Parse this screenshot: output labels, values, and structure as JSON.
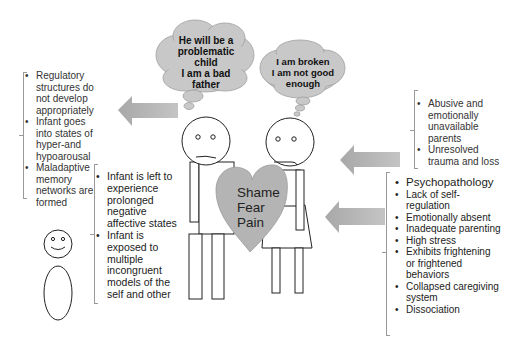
{
  "thought_bubbles": {
    "father": {
      "lines": [
        "He will be a",
        "problematic",
        "child",
        "I am a bad",
        "father"
      ]
    },
    "mother": {
      "lines": [
        "I am broken",
        "I am not good",
        "enough"
      ]
    }
  },
  "heart": {
    "lines": [
      "Shame",
      "Fear",
      "Pain"
    ]
  },
  "left_effects": {
    "items": [
      "Regulatory structures do not develop appropriately",
      "Infant goes into states of hyper-and hypoarousal",
      "Maladaptive memory networks are formed"
    ]
  },
  "infant_experience": {
    "items": [
      "Infant is left to experience prolonged negative affective states",
      "Infant is exposed to multiple incongruent models of the self and other"
    ]
  },
  "right_origins": {
    "items": [
      "Abusive and emotionally unavailable parents",
      "Unresolved trauma and loss"
    ]
  },
  "right_parent_traits": {
    "items": [
      "Psychopathology",
      "Lack of self-regulation",
      "Emotionally absent",
      "Inadequate parenting",
      "High stress",
      "Exhibits frightening or frightened behaviors",
      "Collapsed caregiving system",
      "Dissociation"
    ]
  },
  "colors": {
    "cloud_fill": "#c8c8c8",
    "heart_fill": "#b4b4b4",
    "arrow_fill": "#b0b0b0",
    "line": "#222222",
    "bracket": "#999999"
  }
}
